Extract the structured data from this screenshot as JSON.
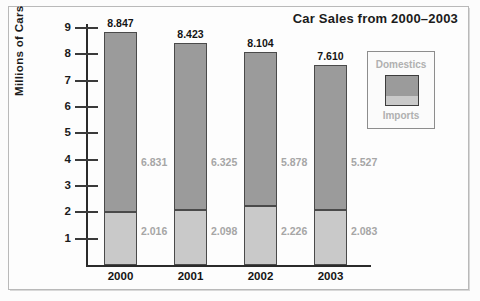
{
  "chart_data": {
    "type": "bar",
    "subtype": "stacked-bar",
    "title": "Car Sales from 2000–2003",
    "xlabel": "",
    "ylabel": "Millions of Cars",
    "categories": [
      "2000",
      "2001",
      "2002",
      "2003"
    ],
    "ylim": [
      0,
      9.4
    ],
    "yticks": [
      1,
      2,
      3,
      4,
      5,
      6,
      7,
      8,
      9
    ],
    "ytick_labels": [
      "1",
      "2",
      "3",
      "4",
      "5",
      "6",
      "7",
      "8",
      "9"
    ],
    "grid": false,
    "legend_position": "top-right-inside",
    "series": [
      {
        "name": "Imports",
        "color": "#c9c9c9",
        "values": [
          2.016,
          2.098,
          2.226,
          2.083
        ],
        "value_labels": [
          "2.016",
          "2.098",
          "2.226",
          "2.083"
        ]
      },
      {
        "name": "Domestics",
        "color": "#9b9b9b",
        "values": [
          6.831,
          6.325,
          5.878,
          5.527
        ],
        "value_labels": [
          "6.831",
          "6.325",
          "5.878",
          "5.527"
        ]
      }
    ],
    "totals": [
      8.847,
      8.423,
      8.104,
      7.61
    ],
    "total_labels": [
      "8.847",
      "8.423",
      "8.104",
      "7.610"
    ]
  },
  "legend": {
    "top_label": "Domestics",
    "bottom_label": "Imports"
  },
  "colors": {
    "domestics": "#9b9b9b",
    "imports": "#c9c9c9",
    "axis": "#2b2b2b",
    "value_label": "#a6a6a6",
    "frame": "#b9b9b9"
  }
}
